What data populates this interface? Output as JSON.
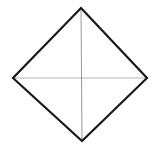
{
  "figure": {
    "name": "rhombus-with-diagonals",
    "type": "line-diagram",
    "canvas": {
      "width": 159,
      "height": 148,
      "background": "#ffffff"
    },
    "shape": {
      "name": "rhombus",
      "stroke_color": "#1a1a1a",
      "stroke_width": 2.2,
      "fill": "none",
      "vertices": {
        "top": {
          "x": 81,
          "y": 8
        },
        "right": {
          "x": 147,
          "y": 78
        },
        "bottom": {
          "x": 82,
          "y": 141
        },
        "left": {
          "x": 13,
          "y": 78
        }
      },
      "points_path": "81,8 147,78 82,141 13,78"
    },
    "diagonals": [
      {
        "name": "vertical-diagonal",
        "x1": 81,
        "y1": 8,
        "x2": 82,
        "y2": 141,
        "stroke_color": "#9a9a9a",
        "stroke_width": 1
      },
      {
        "name": "horizontal-diagonal",
        "x1": 13,
        "y1": 78,
        "x2": 147,
        "y2": 78,
        "stroke_color": "#b5b5b5",
        "stroke_width": 1
      }
    ],
    "center": {
      "x": 81,
      "y": 78
    }
  }
}
